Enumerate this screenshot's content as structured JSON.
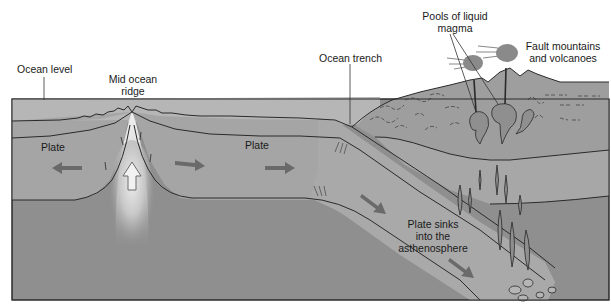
{
  "labels": {
    "ocean_level": "Ocean level",
    "mid_ocean_ridge_line1": "Mid ocean",
    "mid_ocean_ridge_line2": "ridge",
    "ocean_trench": "Ocean trench",
    "pools_line1": "Pools of liquid",
    "pools_line2": "magma",
    "fault_line1": "Fault mountains",
    "fault_line2": "and volcanoes",
    "plate_left": "Plate",
    "plate_right": "Plate",
    "sinks_line1": "Plate sinks",
    "sinks_line2": "into the",
    "sinks_line3": "asthenosphere"
  },
  "colors": {
    "background": "#ffffff",
    "ocean": "#b4b4b4",
    "plate": "#a3a3a3",
    "asthenosphere": "#8f8f8f",
    "continent": "#9c9c9c",
    "slab": "#a8a8a8",
    "outline": "#2a2a2a",
    "arrow": "#6a6a6a",
    "upwelling": "#e6e6e6"
  }
}
